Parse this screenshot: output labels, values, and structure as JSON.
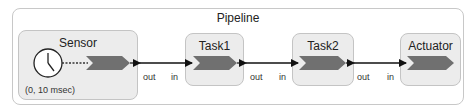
{
  "diagram": {
    "container": {
      "title": "Pipeline"
    },
    "actors": [
      {
        "id": "sensor",
        "title": "Sensor",
        "annotation": "(0, 10 msec)",
        "has_clock": true
      },
      {
        "id": "task1",
        "title": "Task1"
      },
      {
        "id": "task2",
        "title": "Task2"
      },
      {
        "id": "actuator",
        "title": "Actuator"
      }
    ],
    "connections": [
      {
        "from": "Sensor",
        "from_port": "out",
        "to": "Task1",
        "to_port": "in"
      },
      {
        "from": "Task1",
        "from_port": "out",
        "to": "Task2",
        "to_port": "in"
      },
      {
        "from": "Task2",
        "from_port": "out",
        "to": "Actuator",
        "to_port": "in"
      }
    ],
    "colors": {
      "reaction_fill": "#707070",
      "actor_fill": "#ececec",
      "arrow": "#111111"
    }
  }
}
